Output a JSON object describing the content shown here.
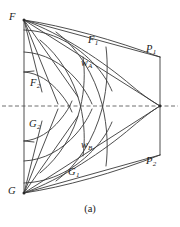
{
  "figure": {
    "caption": "(a)",
    "colors": {
      "stroke": "#3a3a3a",
      "axis": "#4a4a4a",
      "text": "#1a1a1a",
      "background": "#ffffff"
    },
    "labels": {
      "F": {
        "text": "F",
        "sub": "",
        "x": 9,
        "y": 12
      },
      "F1": {
        "text": "F",
        "sub": "1",
        "x": 88,
        "y": 35
      },
      "F2": {
        "text": "F",
        "sub": "2",
        "x": 30,
        "y": 78
      },
      "G": {
        "text": "G",
        "sub": "",
        "x": 8,
        "y": 186
      },
      "G1": {
        "text": "G",
        "sub": "1",
        "x": 68,
        "y": 167
      },
      "G2": {
        "text": "G",
        "sub": "2",
        "x": 29,
        "y": 119
      },
      "G3": {
        "text": "G",
        "sub": "",
        "x": -100,
        "y": -100
      },
      "P1": {
        "text": "P",
        "sub": "1",
        "x": 146,
        "y": 44
      },
      "P2": {
        "text": "P",
        "sub": "2",
        "x": 146,
        "y": 156
      },
      "wA": {
        "text": "w",
        "sub": "A",
        "x": 81,
        "y": 58
      },
      "wB": {
        "text": "w",
        "sub": "B",
        "x": 81,
        "y": 140
      }
    },
    "geometry": {
      "F_point": [
        24,
        20
      ],
      "G_point": [
        24,
        193
      ],
      "P1_point": [
        160,
        57
      ],
      "P2_point": [
        160,
        155
      ],
      "apex_point": [
        160,
        106
      ],
      "axis_y": 106,
      "axis_x_start": 2,
      "axis_x_end": 178,
      "left_edge_x": 24,
      "right_edge_x": 160
    }
  }
}
